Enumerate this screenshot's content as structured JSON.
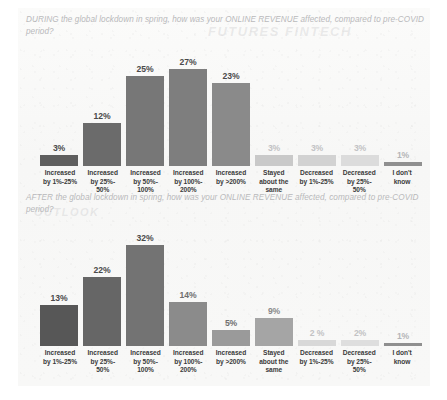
{
  "document": {
    "page_background": "#ffffff",
    "panel_background": "#f8f8f7"
  },
  "charts": [
    {
      "id": "chart-1",
      "title": "DURING the global lockdown in spring, how was your ONLINE REVENUE affected, compared to pre-COVID period?"
    },
    {
      "id": "chart-2",
      "title": "AFTER the global lockdown in spring, how was your ONLINE REVENUE affected, compared to pre-COVID period?"
    }
  ],
  "categories": [
    "Increased by 1%-25%",
    "Increased by 25%-50%",
    "Increased by 50%-100%",
    "Increased by 100%-200%",
    "Increased by >200%",
    "Stayed about the same",
    "Decreased by 1%-25%",
    "Decreased by 25%-50%",
    "I don't know"
  ],
  "category_lines": [
    [
      "Increased",
      "by 1%-25%",
      ""
    ],
    [
      "Increased",
      "by 25%-",
      "50%"
    ],
    [
      "Increased",
      "by 50%-",
      "100%"
    ],
    [
      "Increased",
      "by 100%-",
      "200%"
    ],
    [
      "Increased",
      "by >200%",
      ""
    ],
    [
      "Stayed",
      "about the",
      "same"
    ],
    [
      "Decreased",
      "by 1%-25%",
      ""
    ],
    [
      "Decreased",
      "by 25%-",
      "50%"
    ],
    [
      "I don't",
      "know",
      ""
    ]
  ],
  "chart_data": [
    {
      "type": "bar",
      "title": "DURING the global lockdown in spring, how was your ONLINE REVENUE affected, compared to pre-COVID period?",
      "xlabel": "",
      "ylabel": "",
      "ylim": [
        0,
        30
      ],
      "grid": false,
      "legend": "none",
      "categories": [
        "Increased by 1%-25%",
        "Increased by 25%-50%",
        "Increased by 50%-100%",
        "Increased by 100%-200%",
        "Increased by >200%",
        "Stayed about the same",
        "Decreased by 1%-25%",
        "Decreased by 25%-50%",
        "I don't know"
      ],
      "values": [
        3,
        12,
        25,
        27,
        23,
        3,
        3,
        3,
        1
      ],
      "data_labels": [
        "3%",
        "12%",
        "25%",
        "27%",
        "23%",
        "3%",
        "3%",
        "3%",
        "1%"
      ],
      "bar_colors": [
        "#5f5f5f",
        "#6b6b6b",
        "#777777",
        "#7e7e7e",
        "#8a8a8a",
        "#c9c9c9",
        "#d2d2d2",
        "#dcdcdc",
        "#909090"
      ],
      "label_colors": [
        "#4a4a4a",
        "#4a4a4a",
        "#4a4a4a",
        "#4a4a4a",
        "#4a4a4a",
        "#c2c2c4",
        "#c2c2c4",
        "#c2c2c4",
        "#b5b5b7"
      ]
    },
    {
      "type": "bar",
      "title": "AFTER the global lockdown in spring, how was your ONLINE REVENUE affected, compared to pre-COVID period?",
      "xlabel": "",
      "ylabel": "",
      "ylim": [
        0,
        35
      ],
      "grid": false,
      "legend": "none",
      "categories": [
        "Increased by 1%-25%",
        "Increased by 25%-50%",
        "Increased by 50%-100%",
        "Increased by 100%-200%",
        "Increased by >200%",
        "Stayed about the same",
        "Decreased by 1%-25%",
        "Decreased by 25%-50%",
        "I don't know"
      ],
      "values": [
        13,
        22,
        32,
        14,
        5,
        9,
        2,
        2,
        1
      ],
      "data_labels": [
        "13%",
        "22%",
        "32%",
        "14%",
        "5%",
        "9%",
        "2 %",
        "2%",
        "1%"
      ],
      "bar_colors": [
        "#575757",
        "#666666",
        "#737373",
        "#8b8b8b",
        "#9a9a9a",
        "#a5a5a5",
        "#d8d8d8",
        "#dedede",
        "#8f8f8f"
      ],
      "label_colors": [
        "#4a4a4a",
        "#4a4a4a",
        "#4a4a4a",
        "#6f6f6f",
        "#6f6f6f",
        "#8a8a8a",
        "#c2c2c4",
        "#c2c2c4",
        "#b5b5b7"
      ]
    }
  ],
  "ghost_text": {
    "line_1": "FUTURES FINTECH",
    "line_2": "OUTLOOK"
  }
}
